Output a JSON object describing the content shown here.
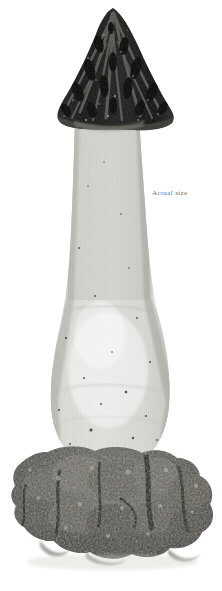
{
  "plate": {
    "kind": "botanical-photographic-plate",
    "background_color": "#ffffff",
    "width_px": 222,
    "height_px": 591,
    "rendering": "black-and-white halftone photograph"
  },
  "caption": {
    "text": "Actual size",
    "color": "#6f6f6f",
    "position": {
      "x_px": 152,
      "y_px": 190
    }
  },
  "specimen": {
    "common_name": "mushroom",
    "parts": [
      {
        "name": "cap",
        "description": "dark conical cap with vertical ridges and elongated pits, flaring skirt at margin",
        "color": "#1f1f1f",
        "bounds_px": {
          "x": 57,
          "y": 8,
          "width": 118,
          "height": 122
        }
      },
      {
        "name": "stem",
        "description": "pale grey stalk with fine vertical striations, widening downward",
        "color": "#c9c9c4",
        "bounds_px": {
          "x": 57,
          "y": 120,
          "width": 95,
          "height": 200
        }
      },
      {
        "name": "bulbous-base",
        "description": "swollen pale whitish base with dark speckles",
        "color": "#ececea",
        "bounds_px": {
          "x": 50,
          "y": 300,
          "width": 122,
          "height": 165
        }
      },
      {
        "name": "soil-clump",
        "description": "clump of dark crumbly earth around the base",
        "color": "#4a4843",
        "bounds_px": {
          "x": 12,
          "y": 440,
          "width": 203,
          "height": 125
        }
      }
    ],
    "palette": {
      "cap_dark": "#151515",
      "cap_mid": "#3a3a38",
      "stem_light": "#d7d7d2",
      "stem_shadow": "#b0b0aa",
      "base_pale": "#f1f1ef",
      "soil_dark": "#2e2c28",
      "soil_mid": "#6a675f",
      "soil_light": "#9b978c",
      "background": "#ffffff"
    }
  }
}
